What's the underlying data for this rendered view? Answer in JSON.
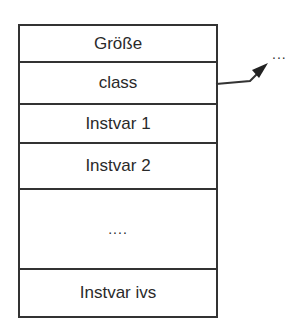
{
  "diagram": {
    "cells": [
      {
        "label": "Größe"
      },
      {
        "label": "class"
      },
      {
        "label": "Instvar 1"
      },
      {
        "label": "Instvar 2"
      },
      {
        "label": "...."
      },
      {
        "label": "Instvar ivs"
      }
    ],
    "pointer_target": "...",
    "pointer_from": "class"
  }
}
